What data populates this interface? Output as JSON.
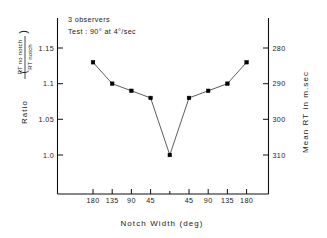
{
  "chart_data": {
    "type": "line",
    "title": "",
    "xlabel": "Notch Width (deg)",
    "ylabel": "Ratio ( RT no notch / RT notch )",
    "ylabel_parts": {
      "prefix": "Ratio",
      "open_paren": "(",
      "numerator": "RT no notch",
      "denominator": "RT notch",
      "close_paren": ")"
    },
    "y2label": "Mean RT in m.sec",
    "grid": false,
    "legend": "none",
    "annotations": [
      "3 observers",
      "Test : 90° at  4°/sec"
    ],
    "x_tick_labels": [
      "180",
      "135",
      "90",
      "45",
      "",
      "45",
      "90",
      "135",
      "180"
    ],
    "x": [
      -180,
      -135,
      -90,
      -45,
      0,
      45,
      90,
      135,
      180
    ],
    "values": [
      1.13,
      1.1,
      1.09,
      1.08,
      1.0,
      1.08,
      1.09,
      1.1,
      1.13
    ],
    "ylim": [
      0.94,
      1.175
    ],
    "y_tick_labels": [
      "1.15",
      "1.1",
      "1.05",
      "1.0"
    ],
    "y_ticks": [
      1.15,
      1.1,
      1.05,
      1.0
    ],
    "y2_tick_labels": [
      "280",
      "290",
      "300",
      "310"
    ],
    "y2_ticks": [
      280,
      290,
      300,
      310
    ],
    "y2lim_note": "right axis inverted: 280 aligns with ratio 1.15, 310 aligns with ratio 1.00",
    "series": [
      {
        "name": "mean ratio",
        "values": [
          1.13,
          1.1,
          1.09,
          1.08,
          1.0,
          1.08,
          1.09,
          1.1,
          1.13
        ],
        "mean_rt_msec": [
          284,
          290,
          292,
          294,
          310,
          294,
          292,
          290,
          284
        ]
      }
    ]
  },
  "colors": {
    "axis": "#111111",
    "marker": "#000000",
    "line": "#333333",
    "background": "#ffffff"
  }
}
